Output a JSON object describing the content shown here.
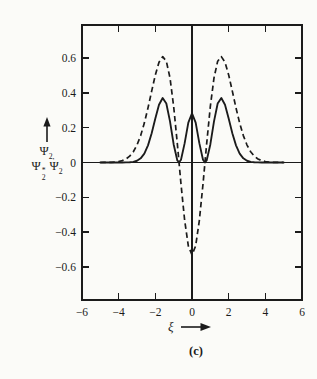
{
  "figure": {
    "caption": "(c)",
    "colors": {
      "background": "#fbfbf8",
      "ink": "#1b1b1b"
    }
  },
  "y_axis_label": {
    "line1_main": "Ψ",
    "line1_sub": "2,",
    "line2_first_main": "Ψ",
    "line2_first_sup": "*",
    "line2_first_sub": "2",
    "line2_second_main": "Ψ",
    "line2_second_sub": "2"
  },
  "x_axis_label": {
    "xi": "ξ"
  },
  "chart_data": {
    "type": "line",
    "title": "",
    "xlabel": "ξ",
    "ylabel": "Ψ2, Ψ2*Ψ2",
    "grid": false,
    "legend": "none",
    "zero_lines": true,
    "x_range": [
      -6,
      6
    ],
    "y_range": [
      -0.79,
      0.79
    ],
    "x_ticks": [
      {
        "v": -6,
        "label": "−6"
      },
      {
        "v": -4,
        "label": "−4"
      },
      {
        "v": -2,
        "label": "−2"
      },
      {
        "v": 0,
        "label": "0"
      },
      {
        "v": 2,
        "label": "2"
      },
      {
        "v": 4,
        "label": "4"
      },
      {
        "v": 6,
        "label": "6"
      }
    ],
    "y_ticks": [
      {
        "v": 0.6,
        "label": "0.6"
      },
      {
        "v": 0.4,
        "label": "0.4"
      },
      {
        "v": 0.2,
        "label": "0.2"
      },
      {
        "v": 0,
        "label": "0"
      },
      {
        "v": -0.2,
        "label": "−0.2"
      },
      {
        "v": -0.4,
        "label": "−0.4"
      },
      {
        "v": -0.6,
        "label": "−0.6"
      }
    ],
    "x": [
      -5,
      -4.8,
      -4.6,
      -4.4,
      -4.2,
      -4,
      -3.8,
      -3.6,
      -3.4,
      -3.2,
      -3,
      -2.8,
      -2.6,
      -2.4,
      -2.2,
      -2,
      -1.8,
      -1.6,
      -1.4,
      -1.2,
      -1,
      -0.8,
      -0.7071,
      -0.6,
      -0.4,
      -0.2,
      0,
      0.2,
      0.4,
      0.6,
      0.7071,
      0.8,
      1,
      1.2,
      1.4,
      1.6,
      1.8,
      2,
      2.2,
      2.4,
      2.6,
      2.8,
      3,
      3.2,
      3.4,
      3.6,
      3.8,
      4,
      4.2,
      4.4,
      4.6,
      4.8,
      5
    ],
    "series": [
      {
        "name": "Ψ2 wavefunction",
        "style": "dashed",
        "values": [
          0.0001,
          0.0002,
          0.0006,
          0.0012,
          0.0027,
          0.0055,
          0.0108,
          0.0203,
          0.0363,
          0.0618,
          0.1003,
          0.1547,
          0.2264,
          0.3136,
          0.41,
          0.5032,
          0.576,
          0.6084,
          0.5821,
          0.486,
          0.3221,
          0.108,
          0,
          -0.1242,
          -0.3334,
          -0.479,
          -0.5311,
          -0.479,
          -0.3334,
          -0.1242,
          0,
          0.108,
          0.3221,
          0.486,
          0.5821,
          0.6084,
          0.576,
          0.5032,
          0.41,
          0.3136,
          0.2264,
          0.1547,
          0.1003,
          0.0618,
          0.0363,
          0.0203,
          0.0108,
          0.0055,
          0.0027,
          0.0012,
          0.0006,
          0.0002,
          0.0001
        ]
      },
      {
        "name": "Ψ2*Ψ2 probability density",
        "style": "solid",
        "values": [
          0,
          0,
          0,
          0,
          0,
          0,
          0.0001,
          0.0004,
          0.0013,
          0.0038,
          0.0101,
          0.0239,
          0.0513,
          0.0984,
          0.1681,
          0.2532,
          0.3318,
          0.3702,
          0.3388,
          0.2362,
          0.1038,
          0.0117,
          0,
          0.0154,
          0.1112,
          0.2294,
          0.2821,
          0.2294,
          0.1112,
          0.0154,
          0,
          0.0117,
          0.1038,
          0.2362,
          0.3388,
          0.3702,
          0.3318,
          0.2532,
          0.1681,
          0.0984,
          0.0513,
          0.0239,
          0.0101,
          0.0038,
          0.0013,
          0.0004,
          0.0001,
          0,
          0,
          0,
          0,
          0,
          0
        ]
      }
    ]
  }
}
